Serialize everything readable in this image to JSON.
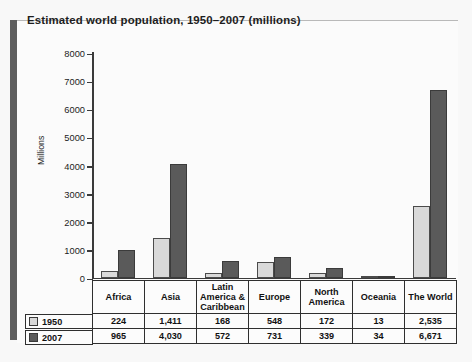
{
  "panel": {
    "title": "Estimated world population, 1950–2007 (millions)"
  },
  "chart_data": {
    "type": "bar",
    "title": "Estimated world population, 1950–2007 (millions)",
    "xlabel": "",
    "ylabel": "Millions",
    "ylim": [
      0,
      8000
    ],
    "yticks": [
      0,
      1000,
      2000,
      3000,
      4000,
      5000,
      6000,
      7000,
      8000
    ],
    "ytick_labels": [
      "0",
      "1000",
      "2000",
      "3000",
      "4000",
      "5000",
      "6000",
      "7000",
      "8000"
    ],
    "grid": false,
    "legend_position": "table-left",
    "categories": [
      "Africa",
      "Asia",
      "Latin America & Caribbean",
      "Europe",
      "North America",
      "Oceania",
      "The World"
    ],
    "series": [
      {
        "name": "1950",
        "color": "#d9d9d9",
        "values": [
          224,
          1411,
          168,
          548,
          172,
          13,
          2535
        ],
        "value_labels": [
          "224",
          "1,411",
          "168",
          "548",
          "172",
          "13",
          "2,535"
        ]
      },
      {
        "name": "2007",
        "color": "#5a5a5a",
        "values": [
          965,
          4030,
          572,
          731,
          339,
          34,
          6671
        ],
        "value_labels": [
          "965",
          "4,030",
          "572",
          "731",
          "339",
          "34",
          "6,671"
        ]
      }
    ]
  },
  "table": {
    "column_headers": [
      "Africa",
      "Asia",
      "Latin\nAmerica &\nCaribbean",
      "Europe",
      "North\nAmerica",
      "Oceania",
      "The World"
    ],
    "header_lines": [
      [
        "Africa"
      ],
      [
        "Asia"
      ],
      [
        "Latin",
        "America &",
        "Caribbean"
      ],
      [
        "Europe"
      ],
      [
        "North",
        "America"
      ],
      [
        "Oceania"
      ],
      [
        "The World"
      ]
    ],
    "rows": [
      {
        "label": "1950",
        "swatch": "light",
        "cells": [
          "224",
          "1,411",
          "168",
          "548",
          "172",
          "13",
          "2,535"
        ]
      },
      {
        "label": "2007",
        "swatch": "dark",
        "cells": [
          "965",
          "4,030",
          "572",
          "731",
          "339",
          "34",
          "6,671"
        ]
      }
    ]
  },
  "colors": {
    "series_1950": "#d9d9d9",
    "series_2007": "#5a5a5a",
    "axis": "#3a3a3a",
    "panel_bg": "#fbfbfb",
    "page_bg": "#f8f8f8",
    "spine": "#5e5e5e"
  }
}
